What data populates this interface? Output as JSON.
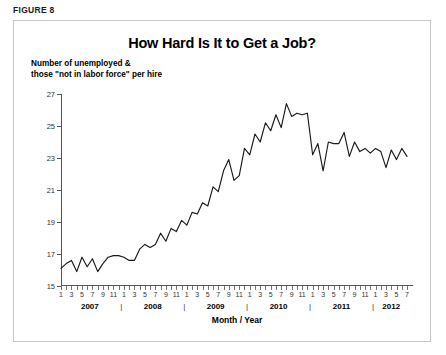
{
  "figure_label": "FIGURE 8",
  "chart_data": {
    "type": "line",
    "title": "How Hard Is It to Get a Job?",
    "ylabel": "Number of unemployed &\nthose \"not in labor force\" per hire",
    "xlabel": "Month / Year",
    "ylim": [
      15,
      27
    ],
    "yticks": [
      15,
      17,
      19,
      21,
      23,
      25,
      27
    ],
    "grid": false,
    "legend": null,
    "month_tick_labels": [
      "1",
      "3",
      "5",
      "7",
      "9",
      "11"
    ],
    "year_groups": [
      "2007",
      "2008",
      "2009",
      "2010",
      "2011",
      "2012"
    ],
    "x_start": "2007-01",
    "x_end": "2012-07",
    "series": [
      {
        "name": "Unemployed & not-in-labor-force per hire",
        "color": "#1a1a1a",
        "x": [
          "2007-01",
          "2007-02",
          "2007-03",
          "2007-04",
          "2007-05",
          "2007-06",
          "2007-07",
          "2007-08",
          "2007-09",
          "2007-10",
          "2007-11",
          "2007-12",
          "2008-01",
          "2008-02",
          "2008-03",
          "2008-04",
          "2008-05",
          "2008-06",
          "2008-07",
          "2008-08",
          "2008-09",
          "2008-10",
          "2008-11",
          "2008-12",
          "2009-01",
          "2009-02",
          "2009-03",
          "2009-04",
          "2009-05",
          "2009-06",
          "2009-07",
          "2009-08",
          "2009-09",
          "2009-10",
          "2009-11",
          "2009-12",
          "2010-01",
          "2010-02",
          "2010-03",
          "2010-04",
          "2010-05",
          "2010-06",
          "2010-07",
          "2010-08",
          "2010-09",
          "2010-10",
          "2010-11",
          "2010-12",
          "2011-01",
          "2011-02",
          "2011-03",
          "2011-04",
          "2011-05",
          "2011-06",
          "2011-07",
          "2011-08",
          "2011-09",
          "2011-10",
          "2011-11",
          "2011-12",
          "2012-01",
          "2012-02",
          "2012-03",
          "2012-04",
          "2012-05",
          "2012-06",
          "2012-07"
        ],
        "values": [
          16.1,
          16.4,
          16.6,
          15.9,
          16.8,
          16.2,
          16.7,
          15.9,
          16.4,
          16.8,
          16.9,
          16.9,
          16.8,
          16.6,
          16.6,
          17.3,
          17.6,
          17.4,
          17.6,
          18.3,
          17.8,
          18.6,
          18.4,
          19.1,
          18.8,
          19.6,
          19.5,
          20.2,
          20.0,
          21.2,
          20.9,
          22.2,
          22.9,
          21.6,
          21.9,
          23.6,
          23.2,
          24.5,
          24.0,
          25.2,
          24.7,
          25.7,
          24.9,
          26.4,
          25.6,
          25.8,
          25.7,
          25.8,
          23.2,
          23.9,
          22.2,
          24.0,
          23.9,
          23.9,
          24.6,
          23.1,
          24.0,
          23.4,
          23.6,
          23.3,
          23.6,
          23.4,
          22.4,
          23.5,
          22.9,
          23.6,
          23.1
        ]
      }
    ]
  }
}
